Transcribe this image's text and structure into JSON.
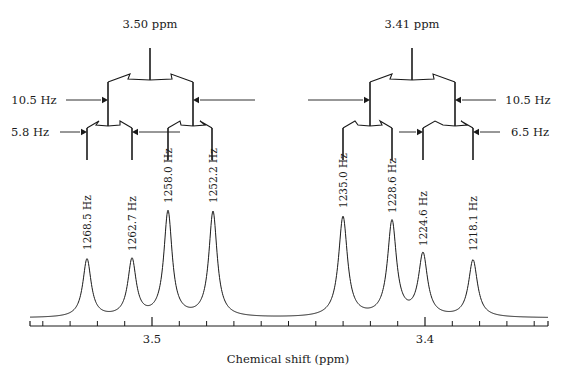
{
  "figure": {
    "kind": "nmr-splitting-diagram",
    "width": 577,
    "height": 380,
    "background": "#ffffff",
    "ink": "#1a1a1a"
  },
  "axis": {
    "label": "Chemical shift (ppm)",
    "major_ticks": [
      {
        "label": "3.5",
        "x": 152
      },
      {
        "label": "3.4",
        "x": 425
      }
    ],
    "minor_tick_spacing_px": 27.3,
    "baseline_y": 326,
    "x_start": 30,
    "x_end": 548,
    "ppm_per_px": 0.000366
  },
  "trees": [
    {
      "id": "left-multiplet-tree",
      "center_label": "3.50 ppm",
      "couplings": [
        {
          "name": "j-large",
          "label": "10.5 Hz",
          "side": "left"
        },
        {
          "name": "j-small",
          "label": "5.8 Hz",
          "side": "left"
        }
      ],
      "leg_labels": []
    },
    {
      "id": "right-multiplet-tree",
      "center_label": "3.41 ppm",
      "couplings": [
        {
          "name": "j-large",
          "label": "10.5 Hz",
          "side": "right"
        },
        {
          "name": "j-small",
          "label": "6.5 Hz",
          "side": "right"
        }
      ],
      "leg_labels": []
    }
  ],
  "chart_data": {
    "type": "line",
    "title": "",
    "xlabel": "Chemical shift (ppm)",
    "ylabel": "",
    "xlim": [
      3.54,
      3.355
    ],
    "grid": false,
    "legend": null,
    "x_axis_direction": "decreasing",
    "tick_labels": [
      "3.5",
      "3.4"
    ],
    "peaks": [
      {
        "label": "1268.5 Hz",
        "x_px": 87,
        "height": 58,
        "width_px": 5.0,
        "ppm": 3.5289
      },
      {
        "label": "1262.7 Hz",
        "x_px": 132,
        "height": 57,
        "width_px": 5.0,
        "ppm": 3.5128
      },
      {
        "label": "1258.0 Hz",
        "x_px": 168,
        "height": 105,
        "width_px": 5.0,
        "ppm": 3.4997
      },
      {
        "label": "1252.2 Hz",
        "x_px": 213,
        "height": 105,
        "width_px": 5.0,
        "ppm": 3.4836
      },
      {
        "label": "1235.0 Hz",
        "x_px": 343,
        "height": 100,
        "width_px": 5.4,
        "ppm": 3.4358
      },
      {
        "label": "1228.6 Hz",
        "x_px": 392,
        "height": 95,
        "width_px": 5.4,
        "ppm": 3.418
      },
      {
        "label": "1224.6 Hz",
        "x_px": 423,
        "height": 62,
        "width_px": 5.4,
        "ppm": 3.4069
      },
      {
        "label": "1218.1 Hz",
        "x_px": 473,
        "height": 57,
        "width_px": 5.4,
        "ppm": 3.3888
      }
    ]
  }
}
